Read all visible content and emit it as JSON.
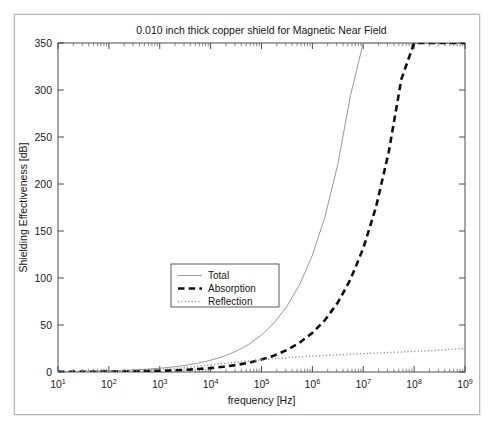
{
  "figure": {
    "title": "0.010 inch thick copper shield for Magnetic Near Field",
    "xlabel": "frequency [Hz]",
    "ylabel": "Shielding Effectiveness [dB]"
  },
  "legend": {
    "position": "center-left",
    "entries": [
      {
        "label": "Total",
        "style": "solid",
        "color": "#8d8d8d"
      },
      {
        "label": "Absorption",
        "style": "dashed",
        "color": "#111111"
      },
      {
        "label": "Reflection",
        "style": "dotted",
        "color": "#8f8f8f"
      }
    ]
  },
  "chart_data": {
    "type": "line",
    "title": "0.010 inch thick copper shield for Magnetic Near Field",
    "xlabel": "frequency [Hz]",
    "ylabel": "Shielding Effectiveness [dB]",
    "xscale": "log",
    "yscale": "linear",
    "xlim": [
      10,
      1000000000
    ],
    "ylim": [
      0,
      350
    ],
    "grid": false,
    "xticks": [
      10,
      100,
      1000,
      10000,
      100000,
      1000000,
      10000000,
      100000000,
      1000000000
    ],
    "xtick_labels": [
      "10^1",
      "10^2",
      "10^3",
      "10^4",
      "10^5",
      "10^6",
      "10^7",
      "10^8",
      "10^9"
    ],
    "yticks": [
      0,
      50,
      100,
      150,
      200,
      250,
      300,
      350
    ],
    "ytick_labels": [
      "0",
      "50",
      "100",
      "150",
      "200",
      "250",
      "300",
      "350"
    ],
    "x": [
      10,
      17.78,
      31.62,
      56.23,
      100,
      177.8,
      316.2,
      562.3,
      1000,
      1778,
      3162,
      5623,
      10000,
      17780,
      31620,
      56230,
      100000,
      177800,
      316200,
      562300,
      1000000,
      1778000,
      3162000,
      5623000,
      10000000,
      17780000,
      31620000,
      56230000,
      100000000,
      177800000,
      316200000,
      562300000,
      1000000000
    ],
    "series": [
      {
        "name": "Total",
        "style": "solid",
        "color": "#8d8d8d",
        "values": [
          0.42,
          0.56,
          0.74,
          0.98,
          1.3,
          1.72,
          2.28,
          3.02,
          4.0,
          5.31,
          7.05,
          9.38,
          12.5,
          16.6,
          22.1,
          29.4,
          39.3,
          52.4,
          69.9,
          93.1,
          124.2,
          165.6,
          220.8,
          294.4,
          350.0,
          350.0,
          350.0,
          350.0,
          350.0,
          350.0,
          350.0,
          350.0,
          350.0
        ]
      },
      {
        "name": "Absorption",
        "style": "dashed",
        "color": "#111111",
        "values": [
          0.13,
          0.18,
          0.24,
          0.31,
          0.42,
          0.56,
          0.74,
          0.99,
          1.32,
          1.76,
          2.34,
          3.12,
          4.16,
          5.55,
          7.4,
          9.86,
          13.2,
          17.5,
          23.4,
          31.2,
          41.6,
          55.4,
          73.9,
          98.6,
          131.5,
          175.3,
          233.7,
          311.6,
          350.0,
          350.0,
          350.0,
          350.0,
          350.0
        ]
      },
      {
        "name": "Reflection",
        "style": "dotted",
        "color": "#8f8f8f",
        "values": [
          0.3,
          0.4,
          0.52,
          0.68,
          0.9,
          1.18,
          1.55,
          2.04,
          2.7,
          3.55,
          4.66,
          6.12,
          7.5,
          9.0,
          10.4,
          11.8,
          13.0,
          14.2,
          15.2,
          16.1,
          16.9,
          17.6,
          18.3,
          18.9,
          19.5,
          20.1,
          20.7,
          21.3,
          21.9,
          22.6,
          23.3,
          24.1,
          25.0
        ]
      }
    ],
    "annotations": []
  },
  "geometry": {
    "plot_left": 43,
    "plot_top": 28,
    "plot_right": 450,
    "plot_bottom": 357,
    "legend_x": 156,
    "legend_y": 249,
    "legend_w": 108,
    "legend_h": 43
  }
}
